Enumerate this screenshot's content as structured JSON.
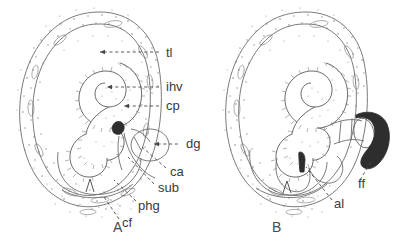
{
  "figure": {
    "type": "scientific-line-drawing",
    "background_color": "#ffffff",
    "ink_color": "#5a5a5a",
    "panels": [
      {
        "id": "A",
        "letter": "A",
        "letter_x": 113,
        "letter_y": 232,
        "labels": [
          {
            "key": "tl",
            "text": "tl",
            "x": 166,
            "y": 57,
            "leader": "dashed-arrow-left",
            "target_x": 98,
            "target_y": 53
          },
          {
            "key": "ihv",
            "text": "ihv",
            "x": 166,
            "y": 91,
            "leader": "dashed-arrow-left",
            "target_x": 105,
            "target_y": 88
          },
          {
            "key": "cp",
            "text": "cp",
            "x": 166,
            "y": 110,
            "leader": "dashed-arrow-left",
            "target_x": 121,
            "target_y": 107
          },
          {
            "key": "dg",
            "text": "dg",
            "x": 186,
            "y": 148,
            "leader": "dashed-arrow-left",
            "target_x": 152,
            "target_y": 144
          },
          {
            "key": "ca",
            "text": "ca",
            "x": 170,
            "y": 176,
            "leader": "dashed-up-left",
            "target_x": 139,
            "target_y": 148
          },
          {
            "key": "sub",
            "text": "sub",
            "x": 158,
            "y": 192,
            "leader": "dashed-up-left",
            "target_x": 126,
            "target_y": 156
          },
          {
            "key": "phg",
            "text": "phg",
            "x": 138,
            "y": 210,
            "leader": "dashed-up-left",
            "target_x": 113,
            "target_y": 178
          },
          {
            "key": "cf",
            "text": "cf",
            "x": 122,
            "y": 227,
            "leader": "dashed-up-left",
            "target_x": 104,
            "target_y": 196
          }
        ]
      },
      {
        "id": "B",
        "letter": "B",
        "letter_x": 272,
        "letter_y": 232,
        "labels": [
          {
            "key": "ff",
            "text": "ff",
            "x": 358,
            "y": 188,
            "leader": "dashed-up-left",
            "target_x": 371,
            "target_y": 162
          },
          {
            "key": "al",
            "text": "al",
            "x": 334,
            "y": 208,
            "leader": "dashed-up-left",
            "target_x": 305,
            "target_y": 166
          }
        ]
      }
    ],
    "legend_keys": {
      "tl": "tl",
      "ihv": "ihv",
      "cp": "cp",
      "dg": "dg",
      "ca": "ca",
      "sub": "sub",
      "phg": "phg",
      "cf": "cf",
      "ff": "ff",
      "al": "al"
    }
  }
}
